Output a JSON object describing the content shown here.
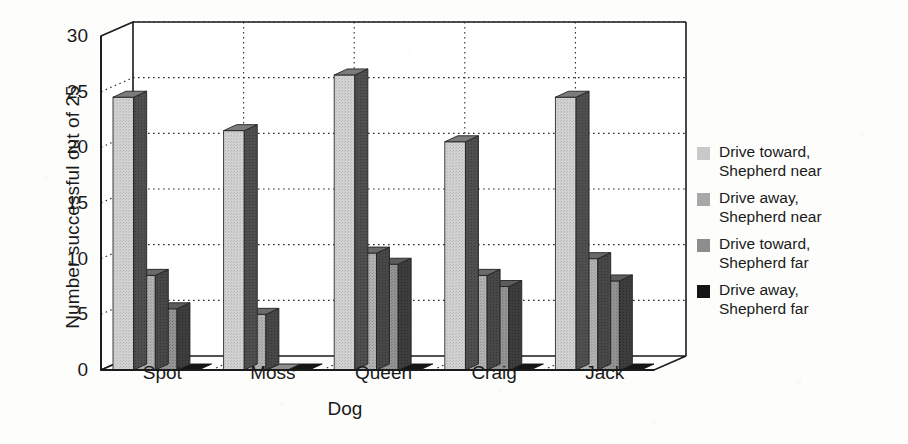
{
  "chart_data": {
    "type": "bar",
    "title": "",
    "subtitle": "",
    "xlabel": "Dog",
    "ylabel": "Number successful out of 25",
    "categories": [
      "Spot",
      "Moss",
      "Queen",
      "Craig",
      "Jack"
    ],
    "series": [
      {
        "name": "Drive toward,\nShepherd near",
        "color": "#c9c9c9",
        "side_color": "#555555",
        "top_color": "#7b7b7b",
        "values": [
          24.5,
          21.5,
          26.5,
          20.5,
          24.5
        ]
      },
      {
        "name": "Drive away,\nShepherd near",
        "color": "#a8a8a8",
        "side_color": "#4a4a4a",
        "top_color": "#6a6a6a",
        "values": [
          8.5,
          5.0,
          10.5,
          8.5,
          10.0
        ]
      },
      {
        "name": "Drive toward,\nShepherd far",
        "color": "#8d8d8d",
        "side_color": "#3f3f3f",
        "top_color": "#5c5c5c",
        "values": [
          5.5,
          0.0,
          9.5,
          7.5,
          8.0
        ]
      },
      {
        "name": "Drive away,\nShepherd far",
        "color": "#151515",
        "side_color": "#000000",
        "top_color": "#2a2a2a",
        "values": [
          0.0,
          0.0,
          0.0,
          0.0,
          0.0
        ]
      }
    ],
    "ylim": [
      0,
      30
    ],
    "yticks": [
      0,
      5,
      10,
      15,
      20,
      25,
      30
    ],
    "ytick_labels": [
      "0",
      "5",
      "10",
      "15",
      "20",
      "25",
      "30"
    ],
    "grid": true,
    "grid_style": "dotted-horizontal",
    "legend_position": "right",
    "projection": "3d-bar",
    "axis_color": "#1a1a1a",
    "background": "#fdfdfc"
  },
  "legend": {
    "entries": [
      {
        "label": "Drive toward,\nShepherd near"
      },
      {
        "label": "Drive away,\nShepherd near"
      },
      {
        "label": "Drive toward,\nShepherd far"
      },
      {
        "label": "Drive away,\nShepherd far"
      }
    ]
  }
}
